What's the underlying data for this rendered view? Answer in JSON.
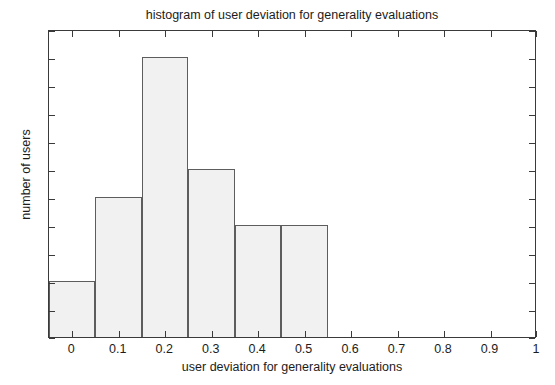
{
  "chart_data": {
    "type": "bar",
    "title": "histogram of user deviation for generality evaluations",
    "xlabel": "user deviation for generality evaluations",
    "ylabel": "number of users",
    "xlim": [
      -0.05,
      1.0
    ],
    "ylim": [
      0,
      11
    ],
    "grid": false,
    "legend": null,
    "bin_width": 0.1,
    "bin_centers": [
      0.0,
      0.1,
      0.2,
      0.3,
      0.4,
      0.5
    ],
    "bin_edges": [
      -0.05,
      0.05,
      0.15,
      0.25,
      0.35,
      0.45,
      0.55
    ],
    "categories": [
      "0.0",
      "0.1",
      "0.2",
      "0.3",
      "0.4",
      "0.5"
    ],
    "values": [
      2,
      5,
      10,
      6,
      4,
      4
    ],
    "bars": [
      {
        "center": 0.0,
        "left": -0.05,
        "right": 0.05,
        "value": 2
      },
      {
        "center": 0.1,
        "left": 0.05,
        "right": 0.15,
        "value": 5
      },
      {
        "center": 0.2,
        "left": 0.15,
        "right": 0.25,
        "value": 10
      },
      {
        "center": 0.3,
        "left": 0.25,
        "right": 0.35,
        "value": 6
      },
      {
        "center": 0.4,
        "left": 0.35,
        "right": 0.45,
        "value": 4
      },
      {
        "center": 0.5,
        "left": 0.45,
        "right": 0.55,
        "value": 4
      }
    ],
    "xticks": [
      0,
      0.1,
      0.2,
      0.3,
      0.4,
      0.5,
      0.6,
      0.7,
      0.8,
      0.9,
      1
    ],
    "xticklabels": [
      "0",
      "0.1",
      "0.2",
      "0.3",
      "0.4",
      "0.5",
      "0.6",
      "0.7",
      "0.8",
      "0.9",
      "1"
    ],
    "yticks": [
      0,
      1,
      2,
      3,
      4,
      5,
      6,
      7,
      8,
      9,
      10,
      11
    ],
    "yticklabels": [
      "0",
      "1",
      "2",
      "3",
      "4",
      "5",
      "6",
      "7",
      "8",
      "9",
      "10",
      "11"
    ],
    "colors": {
      "bar_fill": "#f1f1f1",
      "bar_edge": "#5d5d5d",
      "axis": "#3a3a3a",
      "text": "#1c1c1c",
      "background": "#ffffff"
    }
  }
}
